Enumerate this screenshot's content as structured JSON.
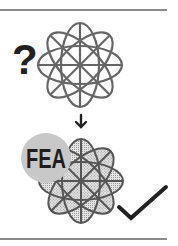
{
  "diagram": {
    "question_mark": "?",
    "fea_label": "FEA",
    "top_shape": "unmeshed-geometry",
    "bottom_shape": "meshed-geometry",
    "arrow": "down-arrow",
    "result": "checkmark"
  },
  "colors": {
    "rule": "#8a8a8a",
    "outline": "#666666",
    "dark": "#222222",
    "fea_disc": "#c8c8c8",
    "mesh_fill": "#e2e2e2",
    "mesh_dot": "#9a9a9a"
  }
}
